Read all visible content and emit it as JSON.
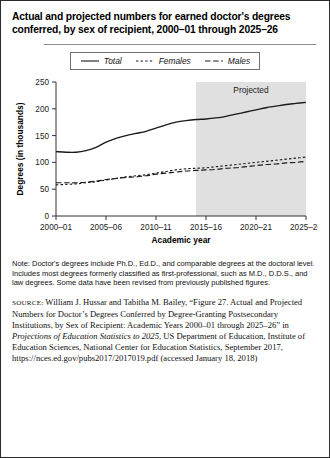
{
  "figure": {
    "title": "Actual and projected numbers for earned doctor's degrees conferred, by sex of recipient, 2000–01 through 2025–26",
    "note_label": "Note:",
    "note_text": "Doctor's degrees include Ph.D., Ed.D., and comparable degrees at the doctoral level. Includes most degrees formerly classified as first-professional, such as M.D., D.D.S., and law degrees. Some data have been revised from previously published figures.",
    "source_label": "SOURCE:",
    "source_part1": "William J. Hussar and Tabitha M. Bailey, “Figure 27. Actual and Projected Numbers for Doctor’s Degrees Conferred by Degree-Granting Postsecondary Institutions, by Sex of Recipient: Academic Years 2000–01 through 2025–26” in ",
    "source_italic": "Projections of Education Statistics to 2025",
    "source_part2": ", US Department of Education, Institute of Education Sciences, National Center for Education Statistics, September 2017, https://nces.ed.gov/pubs2017/2017019.pdf (accessed January 18, 2018)"
  },
  "legend": {
    "items": [
      {
        "label": "Total",
        "style": "solid",
        "color": "#1a1a1a"
      },
      {
        "label": "Females",
        "style": "dotted",
        "color": "#1a1a1a"
      },
      {
        "label": "Males",
        "style": "dashed",
        "color": "#1a1a1a"
      }
    ]
  },
  "chart_data": {
    "type": "line",
    "title": "",
    "xlabel": "Academic year",
    "ylabel": "Degrees (in thousands)",
    "ylim": [
      0,
      250
    ],
    "yticks": [
      0,
      50,
      100,
      150,
      200,
      250
    ],
    "ytick_labels": [
      "0",
      "50",
      "100",
      "150",
      "200",
      "250"
    ],
    "grid": false,
    "legend_position": "top",
    "annotation": "Projected",
    "projected_start_x": "2014–15",
    "categories": [
      "2000–01",
      "2001–02",
      "2002–03",
      "2003–04",
      "2004–05",
      "2005–06",
      "2006–07",
      "2007–08",
      "2008–09",
      "2009–10",
      "2010–11",
      "2011–12",
      "2012–13",
      "2013–14",
      "2014–15",
      "2015–16",
      "2016–17",
      "2017–18",
      "2018–19",
      "2019–20",
      "2020–21",
      "2021–22",
      "2022–23",
      "2023–24",
      "2024–25",
      "2025–26"
    ],
    "xtick_labels": [
      "2000–01",
      "2005–06",
      "2010–11",
      "2015–16",
      "2020–21",
      "2025–26"
    ],
    "xtick_indices": [
      0,
      5,
      10,
      15,
      20,
      25
    ],
    "series": [
      {
        "name": "Total",
        "style": "solid",
        "values": [
          120,
          119,
          119,
          122,
          128,
          138,
          145,
          150,
          154,
          158,
          164,
          170,
          175,
          178,
          180,
          181,
          183,
          186,
          190,
          194,
          198,
          202,
          205,
          208,
          210,
          212
        ]
      },
      {
        "name": "Females",
        "style": "dotted",
        "values": [
          58,
          59,
          60,
          62,
          64,
          67,
          70,
          73,
          75,
          77,
          80,
          83,
          86,
          88,
          89,
          90,
          92,
          94,
          96,
          98,
          100,
          102,
          104,
          106,
          108,
          110
        ]
      },
      {
        "name": "Males",
        "style": "dashed",
        "values": [
          62,
          62,
          62,
          63,
          65,
          68,
          70,
          72,
          73,
          75,
          78,
          80,
          82,
          84,
          85,
          86,
          87,
          89,
          90,
          92,
          94,
          96,
          97,
          99,
          100,
          102
        ]
      }
    ]
  }
}
